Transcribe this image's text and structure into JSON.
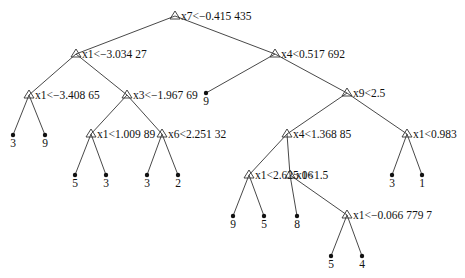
{
  "diagram": {
    "type": "decision-tree",
    "nodes": [
      {
        "id": "n0",
        "kind": "split",
        "label": "x7<−0.415 435",
        "x": 175,
        "y": 16
      },
      {
        "id": "n1",
        "kind": "split",
        "label": "x1<−3.034 27",
        "x": 76,
        "y": 54,
        "parent": "n0"
      },
      {
        "id": "n2",
        "kind": "split",
        "label": "x4<0.517 692",
        "x": 275,
        "y": 54,
        "parent": "n0"
      },
      {
        "id": "n3",
        "kind": "split",
        "label": "x1<−3.408 65",
        "x": 29,
        "y": 95,
        "parent": "n1"
      },
      {
        "id": "n4",
        "kind": "split",
        "label": "x3<−1.967 69",
        "x": 127,
        "y": 95,
        "parent": "n1"
      },
      {
        "id": "n5",
        "kind": "leaf",
        "label": "9",
        "x": 206,
        "y": 93,
        "parent": "n2"
      },
      {
        "id": "n6",
        "kind": "split",
        "label": "x9<2.5",
        "x": 347,
        "y": 93,
        "parent": "n2"
      },
      {
        "id": "n7",
        "kind": "leaf",
        "label": "3",
        "x": 13,
        "y": 135,
        "parent": "n3"
      },
      {
        "id": "n8",
        "kind": "leaf",
        "label": "9",
        "x": 45,
        "y": 135,
        "parent": "n3"
      },
      {
        "id": "n9",
        "kind": "split",
        "label": "x1<1.009 89",
        "x": 91,
        "y": 134,
        "parent": "n4"
      },
      {
        "id": "n10",
        "kind": "split",
        "label": "x6<2.251 32",
        "x": 162,
        "y": 134,
        "parent": "n4"
      },
      {
        "id": "n11",
        "kind": "split",
        "label": "x4<1.368 85",
        "x": 287,
        "y": 134,
        "parent": "n6"
      },
      {
        "id": "n12",
        "kind": "split",
        "label": "x1<0.983",
        "x": 407,
        "y": 134,
        "parent": "n6"
      },
      {
        "id": "n13",
        "kind": "leaf",
        "label": "5",
        "x": 75,
        "y": 175,
        "parent": "n9"
      },
      {
        "id": "n14",
        "kind": "leaf",
        "label": "3",
        "x": 106,
        "y": 175,
        "parent": "n9"
      },
      {
        "id": "n15",
        "kind": "leaf",
        "label": "3",
        "x": 147,
        "y": 175,
        "parent": "n10"
      },
      {
        "id": "n16",
        "kind": "leaf",
        "label": "2",
        "x": 178,
        "y": 175,
        "parent": "n10"
      },
      {
        "id": "n17",
        "kind": "split",
        "label": "x1<2.625 06",
        "x": 249,
        "y": 175,
        "parent": "n11"
      },
      {
        "id": "n18",
        "kind": "split",
        "label": "x1<1.5",
        "x": 290,
        "y": 175,
        "parent": "n11"
      },
      {
        "id": "n19",
        "kind": "leaf",
        "label": "3",
        "x": 392,
        "y": 175,
        "parent": "n12"
      },
      {
        "id": "n20",
        "kind": "leaf",
        "label": "1",
        "x": 422,
        "y": 175,
        "parent": "n12"
      },
      {
        "id": "n21",
        "kind": "leaf",
        "label": "9",
        "x": 233,
        "y": 216,
        "parent": "n17"
      },
      {
        "id": "n22",
        "kind": "leaf",
        "label": "5",
        "x": 264,
        "y": 216,
        "parent": "n17"
      },
      {
        "id": "n23",
        "kind": "leaf",
        "label": "8",
        "x": 297,
        "y": 216,
        "parent": "n18"
      },
      {
        "id": "n24",
        "kind": "split",
        "label": "x1<−0.066 779 7",
        "x": 347,
        "y": 215,
        "parent": "n18"
      },
      {
        "id": "n25",
        "kind": "leaf",
        "label": "5",
        "x": 331,
        "y": 256,
        "parent": "n24"
      },
      {
        "id": "n26",
        "kind": "leaf",
        "label": "4",
        "x": 362,
        "y": 256,
        "parent": "n24"
      }
    ]
  }
}
